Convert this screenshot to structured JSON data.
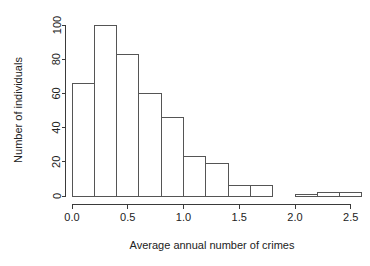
{
  "chart_data": {
    "type": "bar",
    "subtype": "histogram",
    "title": "",
    "xlabel": "Average annual number of crimes",
    "ylabel": "Number of individuals",
    "xlim": [
      0.0,
      2.6
    ],
    "ylim": [
      0,
      100
    ],
    "grid": false,
    "legend": null,
    "bin_width": 0.2,
    "bin_edges": [
      0.0,
      0.2,
      0.4,
      0.6,
      0.8,
      1.0,
      1.2,
      1.4,
      1.6,
      1.8,
      2.0,
      2.2,
      2.4,
      2.6
    ],
    "categories": [
      "0.0-0.2",
      "0.2-0.4",
      "0.4-0.6",
      "0.6-0.8",
      "0.8-1.0",
      "1.0-1.2",
      "1.2-1.4",
      "1.4-1.6",
      "1.6-1.8",
      "1.8-2.0",
      "2.0-2.2",
      "2.2-2.4",
      "2.4-2.6"
    ],
    "values": [
      66,
      100,
      83,
      60,
      46,
      23,
      19,
      6,
      6,
      0,
      1,
      2,
      2
    ],
    "x_ticks": [
      0.0,
      0.5,
      1.0,
      1.5,
      2.0,
      2.5
    ],
    "x_tick_labels": [
      "0.0",
      "0.5",
      "1.0",
      "1.5",
      "2.0",
      "2.5"
    ],
    "y_ticks": [
      0,
      20,
      40,
      60,
      80,
      100
    ],
    "y_tick_labels": [
      "0",
      "20",
      "40",
      "60",
      "80",
      "100"
    ],
    "colors": {
      "bar_fill": "#ffffff",
      "bar_stroke": "#555555",
      "axis": "#3a3a3a",
      "text": "#222222",
      "background": "#ffffff"
    }
  }
}
